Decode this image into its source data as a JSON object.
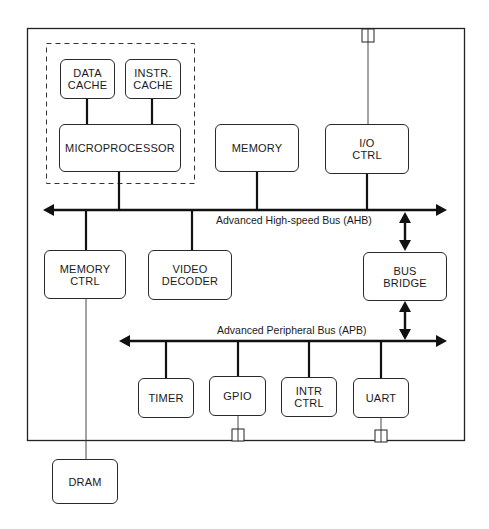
{
  "diagram": {
    "type": "block-diagram",
    "blocks": {
      "data_cache": "DATA\nCACHE",
      "instr_cache": "INSTR.\nCACHE",
      "microprocessor": "MICROPROCESSOR",
      "memory": "MEMORY",
      "io_ctrl": "I/O\nCTRL",
      "memory_ctrl": "MEMORY\nCTRL",
      "video_decoder": "VIDEO\nDECODER",
      "bus_bridge": "BUS\nBRIDGE",
      "timer": "TIMER",
      "gpio": "GPIO",
      "intr_ctrl": "INTR\nCTRL",
      "uart": "UART",
      "dram": "DRAM"
    },
    "buses": {
      "ahb": "Advanced High-speed Bus (AHB)",
      "apb": "Advanced Peripheral Bus (APB)"
    },
    "groups": {
      "cpu_subsystem": [
        "DATA CACHE",
        "INSTR. CACHE",
        "MICROPROCESSOR"
      ]
    },
    "connections": [
      [
        "DATA CACHE",
        "MICROPROCESSOR"
      ],
      [
        "INSTR. CACHE",
        "MICROPROCESSOR"
      ],
      [
        "MICROPROCESSOR",
        "AHB"
      ],
      [
        "MEMORY",
        "AHB"
      ],
      [
        "I/O CTRL",
        "AHB"
      ],
      [
        "I/O CTRL",
        "external pin (top)"
      ],
      [
        "MEMORY CTRL",
        "AHB"
      ],
      [
        "VIDEO DECODER",
        "AHB"
      ],
      [
        "AHB",
        "BUS BRIDGE"
      ],
      [
        "BUS BRIDGE",
        "APB"
      ],
      [
        "TIMER",
        "APB"
      ],
      [
        "GPIO",
        "APB"
      ],
      [
        "INTR CTRL",
        "APB"
      ],
      [
        "UART",
        "APB"
      ],
      [
        "GPIO",
        "external pin (bottom)"
      ],
      [
        "UART",
        "external pin (bottom)"
      ],
      [
        "MEMORY CTRL",
        "DRAM"
      ]
    ],
    "colors": {
      "line": "#1a1a1a",
      "background": "#ffffff"
    }
  }
}
